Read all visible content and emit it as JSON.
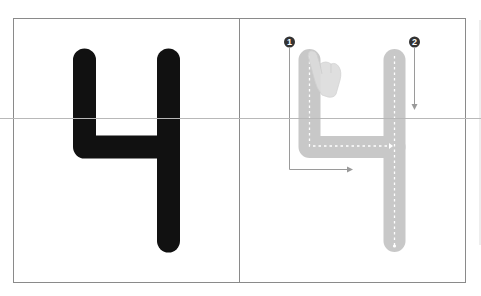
{
  "worksheet": {
    "digit": "4",
    "colors": {
      "background": "#ffffff",
      "frame": "#8a8a8a",
      "midline": "#b8b8b8",
      "solid_digit": "#111111",
      "trace_digit": "#c8c8c8",
      "trace_dash": "#ffffff",
      "guide_arrow": "#9a9a9a",
      "badge_fill": "#333333",
      "badge_text": "#ffffff",
      "hand": "#dcdcdc"
    },
    "left_panel": {
      "label": "model-digit",
      "digit": "4"
    },
    "right_panel": {
      "label": "trace-digit",
      "strokes": [
        {
          "number": "1",
          "direction": "down-then-right"
        },
        {
          "number": "2",
          "direction": "down"
        }
      ],
      "hand_hint": "pointing-hand"
    }
  }
}
